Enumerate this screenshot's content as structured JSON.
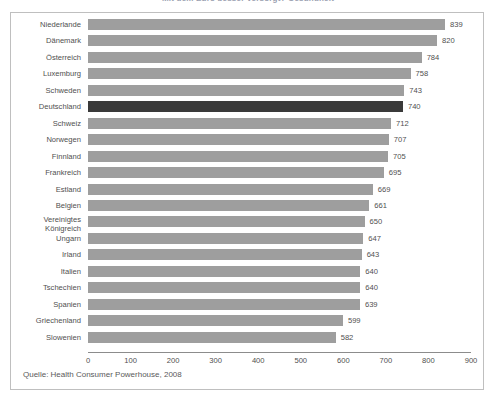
{
  "chart_data": {
    "type": "bar",
    "orientation": "horizontal",
    "title": "Mit dem Euro besser versorgt? Gesundheit",
    "xlabel": "",
    "ylabel": "",
    "xlim": [
      0,
      900
    ],
    "xticks": [
      0,
      100,
      200,
      300,
      400,
      500,
      600,
      700,
      800,
      900
    ],
    "grid": false,
    "legend": false,
    "categories": [
      "Niederlande",
      "Dänemark",
      "Österreich",
      "Luxemburg",
      "Schweden",
      "Deutschland",
      "Schweiz",
      "Norwegen",
      "Finnland",
      "Frankreich",
      "Estland",
      "Belgien",
      "Vereinigtes\nKönigreich",
      "Ungarn",
      "Irland",
      "Italien",
      "Tschechien",
      "Spanien",
      "Griechenland",
      "Slowenien"
    ],
    "values": [
      839,
      820,
      784,
      758,
      743,
      740,
      712,
      707,
      705,
      695,
      669,
      661,
      650,
      647,
      643,
      640,
      640,
      639,
      599,
      582
    ],
    "highlight_index": 5,
    "source": "Quelle: Health Consumer Powerhouse, 2008"
  },
  "colors": {
    "bar": "#9e9e9e",
    "bar_highlight": "#3a3a3a",
    "axis": "#8c8c8c",
    "border": "#bfbfbf",
    "text": "#4f4f4f",
    "background": "#ffffff"
  }
}
